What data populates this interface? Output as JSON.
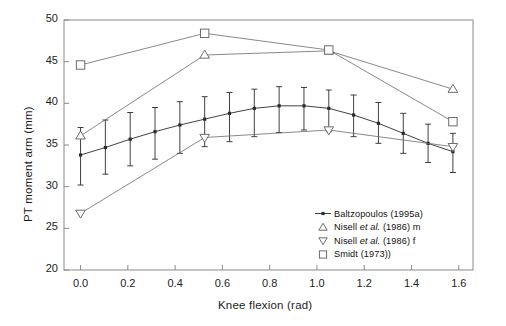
{
  "chart_data": {
    "type": "line",
    "title": "",
    "xlabel": "Knee flexion (rad)",
    "ylabel": "PT moment arm (mm)",
    "xlim": [
      -0.07,
      1.66
    ],
    "ylim": [
      20,
      50
    ],
    "xticks": [
      "0.0",
      "0.2",
      "0.4",
      "0.6",
      "0.8",
      "1.0",
      "1.2",
      "1.4",
      "1.6"
    ],
    "xtick_values": [
      0.0,
      0.2,
      0.4,
      0.6,
      0.8,
      1.0,
      1.2,
      1.4,
      1.6
    ],
    "yticks": [
      "20",
      "25",
      "30",
      "35",
      "40",
      "45",
      "50"
    ],
    "ytick_values": [
      20,
      25,
      30,
      35,
      40,
      45,
      50
    ],
    "grid": false,
    "legend_position": "bottom-right",
    "series": [
      {
        "name": "Baltzopoulos (1995a)",
        "marker": "filled-dot",
        "has_error_bars": true,
        "x": [
          0.0,
          0.105,
          0.21,
          0.315,
          0.42,
          0.525,
          0.63,
          0.735,
          0.84,
          0.945,
          1.05,
          1.155,
          1.26,
          1.365,
          1.47,
          1.575
        ],
        "y": [
          33.8,
          34.7,
          35.7,
          36.6,
          37.4,
          38.1,
          38.8,
          39.4,
          39.7,
          39.7,
          39.4,
          38.6,
          37.6,
          36.4,
          35.2,
          34.2
        ],
        "yerr_low": [
          30.2,
          31.5,
          32.5,
          33.3,
          34.0,
          34.8,
          35.4,
          36.0,
          36.5,
          36.8,
          36.6,
          36.0,
          35.2,
          34.0,
          32.9,
          31.7
        ],
        "yerr_high": [
          37.1,
          38.0,
          38.9,
          39.5,
          40.2,
          40.8,
          41.3,
          41.7,
          42.0,
          41.9,
          41.6,
          41.0,
          40.1,
          38.8,
          37.5,
          36.4
        ]
      },
      {
        "name": "Nisell et al. (1986) m",
        "marker": "triangle-up",
        "has_error_bars": false,
        "x": [
          0.0,
          0.525,
          1.05,
          1.575
        ],
        "y": [
          36.1,
          45.8,
          46.3,
          41.7
        ]
      },
      {
        "name": "Nisell et al. (1986) f",
        "marker": "triangle-down",
        "has_error_bars": false,
        "x": [
          0.0,
          0.525,
          1.05,
          1.575
        ],
        "y": [
          26.8,
          35.9,
          36.8,
          34.8
        ]
      },
      {
        "name": "Smidt (1973))",
        "marker": "square",
        "has_error_bars": false,
        "x": [
          0.0,
          0.525,
          1.05,
          1.575
        ],
        "y": [
          44.6,
          48.4,
          46.4,
          37.8
        ]
      }
    ]
  },
  "legend": {
    "entries": [
      {
        "label_pre": "Baltzopoulos (1995a)",
        "label_italic": "",
        "label_post": "",
        "marker": "filled-dot"
      },
      {
        "label_pre": "Nisell ",
        "label_italic": "et al.",
        "label_post": " (1986) m",
        "marker": "triangle-up"
      },
      {
        "label_pre": "Nisell ",
        "label_italic": "et al.",
        "label_post": " (1986) f",
        "marker": "triangle-down"
      },
      {
        "label_pre": "Smidt (1973))",
        "label_italic": "",
        "label_post": "",
        "marker": "square"
      }
    ]
  },
  "colors": {
    "axis": "#8a8a8a",
    "ink": "#1c1c1c",
    "series_primary": "#2b2b2b",
    "series_open": "#6b6b6b",
    "background": "#ffffff"
  }
}
